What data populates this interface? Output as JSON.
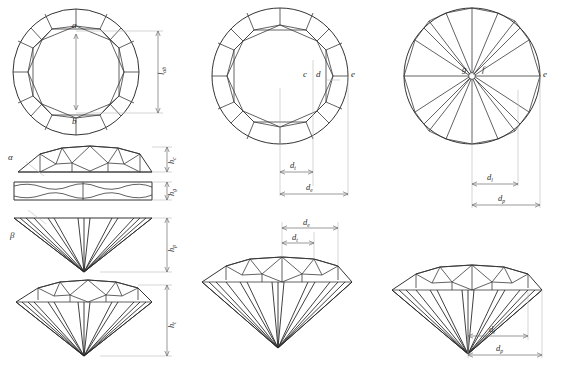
{
  "figure": {
    "line_color": "#3a3a3a",
    "dimension_color": "#b9b9b9",
    "background": "#ffffff"
  },
  "panels": {
    "crown_plan": {
      "name": "Crown plan view",
      "point_labels": [
        "a",
        "b"
      ],
      "dimension_labels": [
        {
          "symbol": "l",
          "subscript": "ab"
        }
      ]
    },
    "table_plan": {
      "name": "Table / star facet plan view",
      "point_labels": [
        "c",
        "d",
        "e"
      ],
      "dimension_labels": [
        {
          "symbol": "d",
          "subscript": "t"
        },
        {
          "symbol": "d",
          "subscript": "e"
        }
      ]
    },
    "pavilion_plan": {
      "name": "Pavilion plan view",
      "point_labels": [
        "g",
        "f",
        "e"
      ],
      "dimension_labels": [
        {
          "symbol": "d",
          "subscript": "l"
        },
        {
          "symbol": "d",
          "subscript": "p"
        }
      ]
    },
    "crown_profile": {
      "name": "Crown profile section",
      "angle_labels": [
        "α"
      ],
      "dimension_labels": [
        {
          "symbol": "h",
          "subscript": "c"
        }
      ]
    },
    "girdle_profile": {
      "name": "Girdle profile section",
      "dimension_labels": [
        {
          "symbol": "h",
          "subscript": "g"
        }
      ]
    },
    "pavilion_profile": {
      "name": "Pavilion profile section",
      "angle_labels": [
        "β"
      ],
      "dimension_labels": [
        {
          "symbol": "h",
          "subscript": "p"
        }
      ]
    },
    "full_profile": {
      "name": "Complete stone profile",
      "dimension_labels": [
        {
          "symbol": "h",
          "subscript": "t"
        }
      ]
    },
    "profile_table": {
      "name": "Profile with table dimensions",
      "dimension_labels": [
        {
          "symbol": "d",
          "subscript": "e"
        },
        {
          "symbol": "d",
          "subscript": "t"
        }
      ]
    },
    "profile_pavilion": {
      "name": "Profile with pavilion dimensions",
      "dimension_labels": [
        {
          "symbol": "d",
          "subscript": "l"
        },
        {
          "symbol": "d",
          "subscript": "p"
        }
      ]
    }
  },
  "labels": {
    "a": "a",
    "b": "b",
    "c": "c",
    "d": "d",
    "e": "e",
    "f": "f",
    "g": "g",
    "alpha": "α",
    "beta": "β",
    "l": "l",
    "d_sym": "d",
    "h_sym": "h",
    "sub_ab": "ab",
    "sub_t": "t",
    "sub_e": "e",
    "sub_l": "l",
    "sub_p": "p",
    "sub_c": "c",
    "sub_g": "g"
  }
}
